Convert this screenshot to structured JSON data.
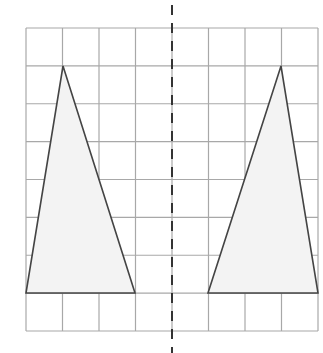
{
  "diagram": {
    "grid": {
      "columns": 8,
      "rows": 8,
      "left": 26,
      "top": 28,
      "right": 318,
      "bottom": 331,
      "line_color": "#a8a8a8"
    },
    "mirror_line": {
      "x": 172,
      "y_start": 5,
      "y_end": 353,
      "dash": "10 8",
      "color": "#333333"
    },
    "triangles": [
      {
        "name": "left-triangle",
        "points": [
          [
            63,
            66
          ],
          [
            26,
            293
          ],
          [
            135,
            293
          ]
        ],
        "fill": "#f3f3f3",
        "stroke": "#444444"
      },
      {
        "name": "right-triangle",
        "points": [
          [
            281,
            66
          ],
          [
            208,
            293
          ],
          [
            318,
            293
          ]
        ],
        "fill": "#f3f3f3",
        "stroke": "#444444"
      }
    ]
  }
}
